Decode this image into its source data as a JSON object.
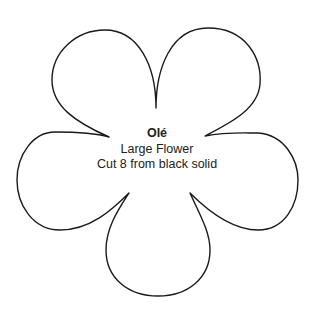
{
  "template": {
    "shape": "five-petal flower outline",
    "stroke_color": "#1a1a1a",
    "background_color": "#ffffff",
    "title": "Olé",
    "subtitle": "Large Flower",
    "instruction": "Cut 8 from black solid"
  }
}
